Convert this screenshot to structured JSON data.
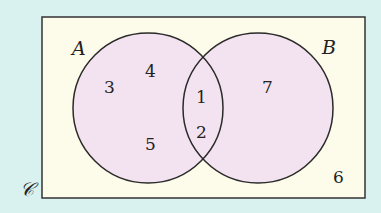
{
  "diagram": {
    "type": "venn",
    "universal_label": "𝒞",
    "sets": [
      {
        "name": "A",
        "label": "A"
      },
      {
        "name": "B",
        "label": "B"
      }
    ],
    "regions": {
      "a_only": [
        "3",
        "4",
        "5"
      ],
      "a_and_b": [
        "1",
        "2"
      ],
      "b_only": [
        "7"
      ],
      "outside": [
        "6"
      ]
    },
    "colors": {
      "background": "#d9f1ef",
      "universe_fill": "#fdfbe9",
      "set_fill": "#f3e3f0",
      "stroke": "#2a2a2a"
    }
  }
}
